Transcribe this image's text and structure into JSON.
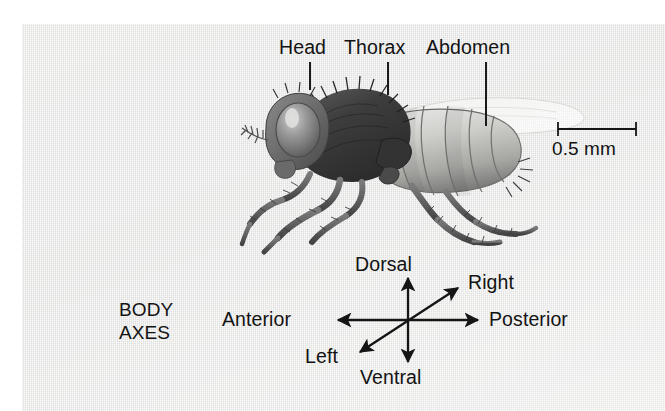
{
  "figure": {
    "background_color": "#e4e4e3",
    "page_color": "#ffffff",
    "ink_color": "#131313"
  },
  "anatomy": {
    "labels": [
      {
        "name": "head",
        "text": "Head"
      },
      {
        "name": "thorax",
        "text": "Thorax"
      },
      {
        "name": "abdomen",
        "text": "Abdomen"
      }
    ]
  },
  "scale_bar": {
    "value": "0.5 mm",
    "name": "scale-bar"
  },
  "body_axes": {
    "caption_line1": "BODY",
    "caption_line2": "AXES",
    "axes": [
      {
        "name": "dorsal",
        "text": "Dorsal",
        "direction": "up"
      },
      {
        "name": "ventral",
        "text": "Ventral",
        "direction": "down"
      },
      {
        "name": "anterior",
        "text": "Anterior",
        "direction": "left"
      },
      {
        "name": "posterior",
        "text": "Posterior",
        "direction": "right"
      },
      {
        "name": "right",
        "text": "Right",
        "direction": "upper-right"
      },
      {
        "name": "left",
        "text": "Left",
        "direction": "lower-left"
      }
    ]
  }
}
